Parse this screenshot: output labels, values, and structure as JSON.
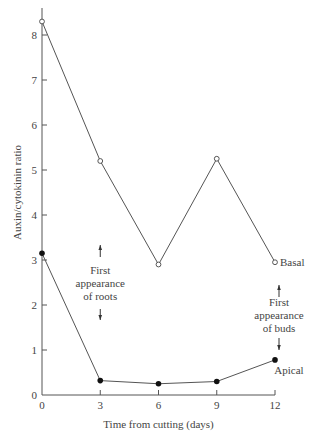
{
  "chart_data": {
    "type": "line",
    "title": "",
    "xlabel": "Time from cutting (days)",
    "ylabel": "Auxin/cytokinin ratio",
    "x": [
      0,
      3,
      6,
      9,
      12
    ],
    "xticks": [
      "0",
      "3",
      "6",
      "9",
      "12"
    ],
    "yticks": [
      "0",
      "1",
      "2",
      "3",
      "4",
      "5",
      "6",
      "7",
      "8"
    ],
    "xlim": [
      0,
      12
    ],
    "ylim": [
      0,
      8.5
    ],
    "grid": false,
    "legend": "inline labels at series ends",
    "series": [
      {
        "name": "Basal",
        "marker": "open-circle",
        "values": [
          8.3,
          5.2,
          2.9,
          5.25,
          2.95
        ]
      },
      {
        "name": "Apical",
        "marker": "filled-circle",
        "values": [
          3.15,
          0.32,
          0.25,
          0.3,
          0.78
        ]
      }
    ],
    "annotations": [
      {
        "text": [
          "First",
          "appearance",
          "of roots"
        ],
        "x": 3,
        "y": 3.0,
        "arrows": "up-down"
      },
      {
        "text": [
          "First",
          "appearance",
          "of buds"
        ],
        "x": 12,
        "y": 1.7,
        "arrows": "up-down"
      }
    ]
  }
}
